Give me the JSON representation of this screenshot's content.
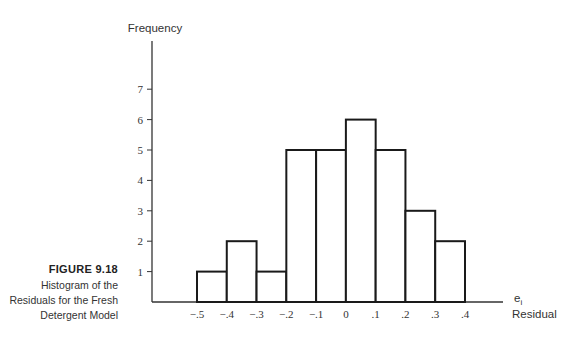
{
  "figure": {
    "number": "FIGURE 9.18",
    "caption_lines": [
      "Histogram of the",
      "Residuals for the Fresh",
      "Detergent Model"
    ]
  },
  "chart_data": {
    "type": "bar",
    "subtype": "histogram",
    "title": "Histogram of the Residuals for the Fresh Detergent Model",
    "xlabel": "Residual",
    "xlabel_symbol": "e",
    "xlabel_subscript": "i",
    "ylabel": "Frequency",
    "bin_edges": [
      -0.5,
      -0.4,
      -0.3,
      -0.2,
      -0.1,
      0,
      0.1,
      0.2,
      0.3,
      0.4
    ],
    "categories": [
      "-.5 to -.4",
      "-.4 to -.3",
      "-.3 to -.2",
      "-.2 to -.1",
      "-.1 to 0",
      "0 to .1",
      ".1 to .2",
      ".2 to .3",
      ".3 to .4"
    ],
    "values": [
      1,
      2,
      1,
      5,
      5,
      6,
      5,
      3,
      2
    ],
    "x_tick_labels": [
      "−.5",
      "−.4",
      "−.3",
      "−.2",
      "−.1",
      "0",
      ".1",
      ".2",
      ".3",
      ".4"
    ],
    "y_tick_labels": [
      "1",
      "2",
      "3",
      "4",
      "5",
      "6",
      "7"
    ],
    "ylim": [
      0,
      7
    ],
    "xlim": [
      -0.5,
      0.4
    ],
    "grid": false,
    "legend": null,
    "colors": {
      "bar_fill": "#ffffff",
      "bar_stroke": "#1a1a1a",
      "axis": "#333333"
    }
  }
}
